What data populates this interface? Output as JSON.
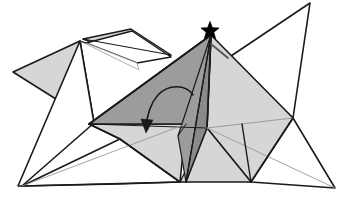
{
  "figure": {
    "kind": "line-drawing",
    "width": 346,
    "height": 197,
    "background_color": "#ffffff",
    "stroke_color": "#1a1a1a",
    "thin_stroke_color": "#8c8c8c",
    "marker_color": "#000000"
  },
  "palette": {
    "white": "#ffffff",
    "light_gray": "#d6d6d6",
    "mid_gray": "#bcbcbc",
    "medium_gray": "#9c9c9c",
    "dark_gray": "#8a8a8a",
    "outline": "#1a1a1a",
    "faint_outline": "#9a9a9a"
  },
  "markers": {
    "star": {
      "name": "apex-star-marker",
      "label": "★",
      "color": "#000000",
      "cx": 210,
      "cy": 31,
      "radius": 9.5
    }
  },
  "arrow": {
    "name": "fold-direction-arrow",
    "path": "M 193 95 C 186 84 168 84 158 95 C 150 104 148 115 146 124",
    "head_points": "146,133 141,119 153,120",
    "color": "#1a1a1a",
    "stroke_width": 1.6
  },
  "faces": [
    {
      "id": "left-wing-light",
      "name": "face-left-wing",
      "fill": "#d6d6d6",
      "stroke": "#1a1a1a",
      "stroke_width": 1.6,
      "points": "13,72 80,41 94,123"
    },
    {
      "id": "left-wing-white-lower",
      "name": "face-left-lower-white",
      "fill": "#ffffff",
      "stroke": "#1a1a1a",
      "stroke_width": 1.6,
      "points": "80,41 94,123 22,186 18,186"
    },
    {
      "id": "upper-sliver-outer",
      "name": "face-upper-sliver-outer",
      "fill": "#d6d6d6",
      "stroke": "#1a1a1a",
      "stroke_width": 1.4,
      "points": "83,39 131,29 171,55 139,60"
    },
    {
      "id": "upper-sliver-inner",
      "name": "face-upper-sliver-inner",
      "fill": "#ffffff",
      "stroke": "#1a1a1a",
      "stroke_width": 1.4,
      "points": "86,43 137,63 171,57 132,31"
    },
    {
      "id": "upper-white-gap",
      "name": "face-upper-white-gap",
      "fill": "#ffffff",
      "stroke": "#9a9a9a",
      "stroke_width": 0.8,
      "points": "80,41 86,43 137,63 139,70"
    },
    {
      "id": "top-right-white",
      "name": "face-top-right-white",
      "fill": "#ffffff",
      "stroke": "#1a1a1a",
      "stroke_width": 1.6,
      "points": "310,3 228,58 293,118"
    },
    {
      "id": "right-white-lower",
      "name": "face-right-lower-white",
      "fill": "#ffffff",
      "stroke": "#1a1a1a",
      "stroke_width": 1.6,
      "points": "293,118 335,188 251,182 242,124"
    },
    {
      "id": "bottom-left-white",
      "name": "face-bottom-left-white",
      "fill": "#ffffff",
      "stroke": "#1a1a1a",
      "stroke_width": 1.6,
      "points": "22,186 120,139 180,182 118,184"
    },
    {
      "id": "right-panel-light",
      "name": "face-right-panel",
      "fill": "#d6d6d6",
      "stroke": "#1a1a1a",
      "stroke_width": 1.6,
      "points": "211,35 293,118 251,182 207,128"
    },
    {
      "id": "right-panel-lower-light",
      "name": "face-right-panel-lower",
      "fill": "#d6d6d6",
      "stroke": "#1a1a1a",
      "stroke_width": 1.4,
      "points": "207,128 251,182 180,182"
    },
    {
      "id": "left-panel-light",
      "name": "face-left-panel",
      "fill": "#d6d6d6",
      "stroke": "#1a1a1a",
      "stroke_width": 1.6,
      "points": "89,124 186,124 180,182 120,139"
    },
    {
      "id": "center-dark-left",
      "name": "face-center-dark-left",
      "fill": "#9c9c9c",
      "stroke": "#1a1a1a",
      "stroke_width": 1.6,
      "points": "211,35 89,124 186,124 186,182"
    },
    {
      "id": "center-dark-right",
      "name": "face-center-dark-right",
      "fill": "#8a8a8a",
      "stroke": "#1a1a1a",
      "stroke_width": 1.6,
      "points": "211,35 207,128 186,182 186,124"
    },
    {
      "id": "center-dark-spine",
      "name": "face-center-dark-spine",
      "fill": "#9c9c9c",
      "stroke": "#1a1a1a",
      "stroke_width": 1.2,
      "points": "211,35 186,182 178,136"
    }
  ],
  "creases": [
    {
      "name": "crease-apex-to-bottom",
      "d": "M 211 35 L 186 182",
      "stroke": "#1a1a1a",
      "width": 1.4
    },
    {
      "name": "crease-apex-to-left-panel",
      "d": "M 211 35 L 89 124",
      "stroke": "#1a1a1a",
      "width": 1.6
    },
    {
      "name": "crease-apex-to-right-fold",
      "d": "M 211 35 L 207 128",
      "stroke": "#1a1a1a",
      "width": 1.4
    },
    {
      "name": "crease-horizontal-mid",
      "d": "M 89 124 L 207 128",
      "stroke": "#1a1a1a",
      "width": 1.2
    },
    {
      "name": "crease-mid-right-extend",
      "d": "M 207 128 L 293 118",
      "stroke": "#9a9a9a",
      "width": 1.0
    },
    {
      "name": "crease-bottom-left-long",
      "d": "M 22 186 L 180 182",
      "stroke": "#1a1a1a",
      "width": 1.4
    },
    {
      "name": "crease-bottom-left-thin",
      "d": "M 22 186 L 186 124",
      "stroke": "#9a9a9a",
      "width": 0.9
    },
    {
      "name": "crease-bottom-right-thin",
      "d": "M 335 188 L 207 128",
      "stroke": "#9a9a9a",
      "width": 0.9
    },
    {
      "name": "crease-left-panel-fold",
      "d": "M 120 139 L 180 182",
      "stroke": "#1a1a1a",
      "width": 1.3
    },
    {
      "name": "crease-left-panel-edge",
      "d": "M 89 124 L 120 139",
      "stroke": "#1a1a1a",
      "width": 1.4
    },
    {
      "name": "crease-right-wing-top",
      "d": "M 228 58 L 211 44",
      "stroke": "#555555",
      "width": 1.8
    },
    {
      "name": "crease-right-panel-fold",
      "d": "M 251 182 L 293 118",
      "stroke": "#1a1a1a",
      "width": 1.5
    },
    {
      "name": "crease-upper-left-short",
      "d": "M 80 41 L 86 43",
      "stroke": "#1a1a1a",
      "width": 1.2
    },
    {
      "name": "crease-sliver-long",
      "d": "M 83 39 L 171 55",
      "stroke": "#1a1a1a",
      "width": 1.2
    },
    {
      "name": "crease-spine-inner",
      "d": "M 186 124 L 178 136",
      "stroke": "#1a1a1a",
      "width": 1.0
    },
    {
      "name": "crease-right-bottom-v",
      "d": "M 251 182 L 242 124",
      "stroke": "#1a1a1a",
      "width": 1.4
    }
  ]
}
